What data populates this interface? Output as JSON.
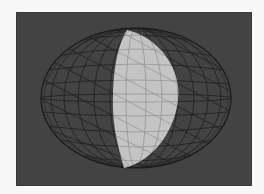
{
  "figure": {
    "colors": {
      "page_background": "#f7f7f7",
      "panel_background": "#434343",
      "wireframe": "#1e1e1e",
      "crescent_fill": "#c4c4c4",
      "crescent_grid": "#8a8a8a"
    },
    "sphere": {
      "cx": 136,
      "cy": 98,
      "rx": 95,
      "ry": 70
    },
    "crescent": {
      "top": [
        127,
        30
      ],
      "bottom": [
        124,
        168
      ],
      "right_extent": 178,
      "left_extent": 113
    }
  }
}
